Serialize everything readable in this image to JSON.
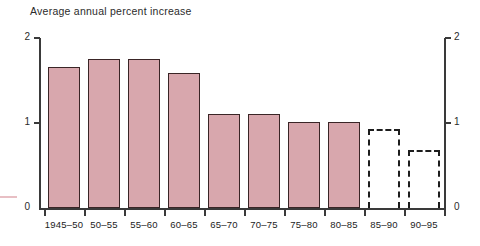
{
  "chart_data": {
    "type": "bar",
    "title": "Average annual percent increase",
    "xlabel": "",
    "ylabel": "",
    "ylim": [
      0,
      2
    ],
    "yticks": [
      0,
      1,
      2
    ],
    "ytick_labels": [
      "0",
      "1",
      "2"
    ],
    "right_axis": true,
    "right_ytick_labels": [
      "0",
      "1",
      "2"
    ],
    "grid": false,
    "legend": "none",
    "categories": [
      "1945–50",
      "50–55",
      "55–60",
      "60–65",
      "65–70",
      "70–75",
      "75–80",
      "80–85",
      "85–90",
      "90–95"
    ],
    "values": [
      1.66,
      1.75,
      1.75,
      1.59,
      1.11,
      1.11,
      1.01,
      1.01,
      0.93,
      0.68
    ],
    "bar_styles": [
      "solid",
      "solid",
      "solid",
      "solid",
      "solid",
      "solid",
      "solid",
      "solid",
      "dashed",
      "dashed"
    ],
    "colors": {
      "bar_fill": "#d8a7ad",
      "bar_stroke": "#3a2526",
      "projected_stroke": "#1d1d1d",
      "axis": "#3a3a3a",
      "text": "#222222"
    }
  }
}
